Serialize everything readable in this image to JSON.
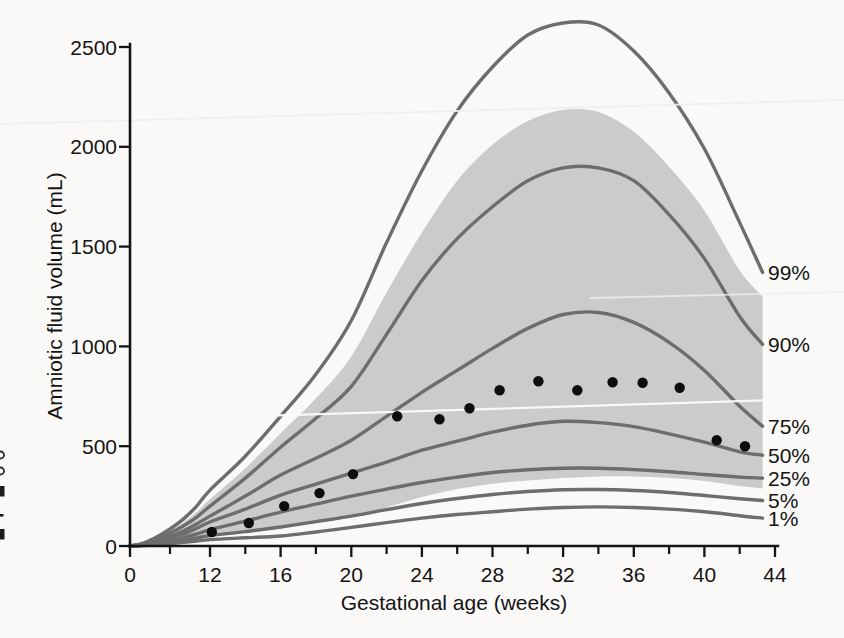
{
  "chart_data": {
    "type": "line",
    "title": "",
    "xlabel": "Gestational age (weeks)",
    "ylabel": "Amniotic fluid volume (mL)",
    "xlim": [
      0,
      44
    ],
    "ylim": [
      0,
      2500
    ],
    "x_axis_note": "axis compressed between week 0 and week 12",
    "x_ticks_major": [
      0,
      12,
      16,
      20,
      24,
      28,
      32,
      36,
      40,
      44
    ],
    "x_ticks_minor": [
      6,
      14,
      18,
      22,
      26,
      30,
      34,
      38,
      42
    ],
    "y_ticks": [
      0,
      500,
      1000,
      1500,
      2000,
      2500
    ],
    "grid": false,
    "legend_position": "right-of-curves",
    "weeks": [
      0,
      2,
      4,
      6,
      8,
      10,
      12,
      14,
      16,
      18,
      20,
      22,
      24,
      26,
      28,
      30,
      32,
      34,
      36,
      38,
      40,
      42,
      43.3
    ],
    "percentile_curves": [
      {
        "label": "99%",
        "values": [
          0,
          15,
          45,
          85,
          135,
          200,
          280,
          450,
          650,
          860,
          1130,
          1520,
          1880,
          2180,
          2400,
          2560,
          2620,
          2610,
          2480,
          2270,
          1990,
          1620,
          1370
        ]
      },
      {
        "label": "90%",
        "values": [
          0,
          12,
          35,
          65,
          100,
          145,
          200,
          340,
          495,
          640,
          800,
          1060,
          1330,
          1540,
          1700,
          1830,
          1895,
          1895,
          1830,
          1660,
          1440,
          1150,
          1010
        ]
      },
      {
        "label": "75%",
        "values": [
          0,
          9,
          26,
          48,
          75,
          110,
          150,
          250,
          355,
          440,
          530,
          650,
          770,
          880,
          990,
          1090,
          1160,
          1170,
          1120,
          1020,
          880,
          700,
          600
        ]
      },
      {
        "label": "50%",
        "values": [
          0,
          8,
          22,
          40,
          60,
          88,
          120,
          185,
          255,
          310,
          365,
          420,
          480,
          525,
          570,
          605,
          625,
          618,
          598,
          562,
          520,
          472,
          455
        ]
      },
      {
        "label": "25%",
        "values": [
          0,
          6,
          16,
          28,
          42,
          60,
          82,
          125,
          170,
          210,
          250,
          285,
          318,
          345,
          368,
          382,
          390,
          390,
          383,
          372,
          358,
          345,
          340
        ]
      },
      {
        "label": "5%",
        "values": [
          0,
          4,
          11,
          19,
          29,
          40,
          52,
          72,
          95,
          122,
          150,
          182,
          213,
          238,
          258,
          273,
          282,
          283,
          278,
          268,
          253,
          237,
          228
        ]
      },
      {
        "label": "1%",
        "values": [
          0,
          2,
          7,
          12,
          18,
          25,
          32,
          41,
          50,
          70,
          93,
          117,
          140,
          158,
          172,
          185,
          193,
          196,
          193,
          185,
          172,
          152,
          140
        ]
      }
    ],
    "confidence_band": {
      "upper": [
        0,
        13,
        40,
        75,
        118,
        170,
        235,
        390,
        565,
        740,
        950,
        1270,
        1570,
        1830,
        2010,
        2130,
        2185,
        2175,
        2075,
        1900,
        1680,
        1380,
        1250
      ],
      "lower": [
        0,
        3,
        9,
        16,
        24,
        34,
        46,
        66,
        88,
        115,
        145,
        193,
        245,
        285,
        312,
        328,
        340,
        348,
        348,
        340,
        325,
        300,
        288
      ]
    },
    "mean_points": {
      "weeks": [
        12.1,
        14.2,
        16.2,
        18.2,
        20.1,
        22.6,
        25.0,
        26.7,
        28.4,
        30.6,
        32.8,
        34.8,
        36.5,
        38.6,
        40.7,
        42.3
      ],
      "values": [
        70,
        115,
        200,
        265,
        360,
        650,
        635,
        690,
        780,
        825,
        780,
        820,
        818,
        793,
        530,
        500
      ]
    },
    "colors": {
      "curve": "#6d6d6d",
      "band": "#cbcbca",
      "points": "#0d0d0d",
      "axis": "#151515",
      "background": "#faf9f7"
    }
  }
}
